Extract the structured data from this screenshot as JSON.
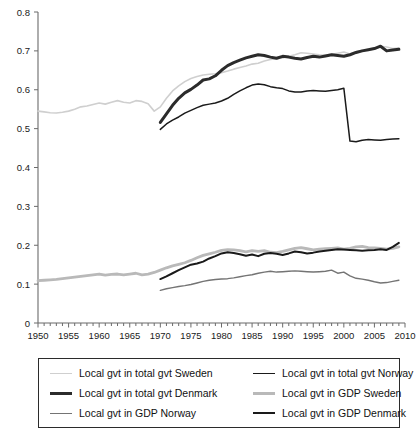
{
  "chart_data": {
    "type": "line",
    "title": "",
    "subtitle": "",
    "xlabel": "",
    "ylabel": "",
    "xlim": [
      1950,
      2010
    ],
    "ylim": [
      0,
      0.8
    ],
    "grid": false,
    "legend_position": "bottom",
    "x_ticks": [
      1950,
      1955,
      1960,
      1965,
      1970,
      1975,
      1980,
      1985,
      1990,
      1995,
      2000,
      2005,
      2010
    ],
    "x_tick_labels": [
      "1950",
      "1955",
      "1960",
      "1965",
      "1970",
      "1975",
      "1980",
      "1985",
      "1990",
      "1995",
      "2000",
      "2005",
      "2010"
    ],
    "x_minor_tick_step": 1,
    "y_ticks": [
      0,
      0.1,
      0.2,
      0.3,
      0.4,
      0.5,
      0.6,
      0.7,
      0.8
    ],
    "y_tick_labels": [
      "0",
      "0.1",
      "0.2",
      "0.3",
      "0.4",
      "0.5",
      "0.6",
      "0.7",
      "0.8"
    ],
    "series": [
      {
        "name": "Local gvt in total gvt Sweden",
        "color": "#cfcfcf",
        "width": 1.6,
        "x": [
          1950,
          1951,
          1952,
          1953,
          1954,
          1955,
          1956,
          1957,
          1958,
          1959,
          1960,
          1961,
          1962,
          1963,
          1964,
          1965,
          1966,
          1967,
          1968,
          1969,
          1970,
          1971,
          1972,
          1973,
          1974,
          1975,
          1976,
          1977,
          1978,
          1979,
          1980,
          1981,
          1982,
          1983,
          1984,
          1985,
          1986,
          1987,
          1988,
          1989,
          1990,
          1991,
          1992,
          1993,
          1994,
          1995,
          1996,
          1997,
          1998,
          1999,
          2000,
          2001,
          2002,
          2003,
          2004,
          2005,
          2006,
          2007,
          2008,
          2009
        ],
        "values": [
          0.545,
          0.543,
          0.541,
          0.54,
          0.542,
          0.545,
          0.55,
          0.556,
          0.558,
          0.562,
          0.566,
          0.563,
          0.568,
          0.572,
          0.568,
          0.566,
          0.572,
          0.57,
          0.564,
          0.545,
          0.556,
          0.578,
          0.597,
          0.61,
          0.621,
          0.629,
          0.634,
          0.638,
          0.64,
          0.641,
          0.644,
          0.648,
          0.653,
          0.657,
          0.661,
          0.666,
          0.668,
          0.674,
          0.678,
          0.68,
          0.682,
          0.686,
          0.69,
          0.695,
          0.694,
          0.692,
          0.69,
          0.689,
          0.691,
          0.694,
          0.697,
          0.692,
          0.698,
          0.701,
          0.703,
          0.706,
          0.712,
          0.71,
          0.706,
          0.707
        ]
      },
      {
        "name": "Local gvt in total gvt  Norway",
        "color": "#1a1a1a",
        "width": 1.5,
        "x": [
          1970,
          1971,
          1972,
          1973,
          1974,
          1975,
          1976,
          1977,
          1978,
          1979,
          1980,
          1981,
          1982,
          1983,
          1984,
          1985,
          1986,
          1987,
          1988,
          1989,
          1990,
          1991,
          1992,
          1993,
          1994,
          1995,
          1996,
          1997,
          1998,
          1999,
          2000,
          2001,
          2002,
          2003,
          2004,
          2005,
          2006,
          2007,
          2008,
          2009
        ],
        "values": [
          0.498,
          0.512,
          0.522,
          0.53,
          0.54,
          0.547,
          0.554,
          0.56,
          0.563,
          0.566,
          0.571,
          0.578,
          0.588,
          0.597,
          0.605,
          0.612,
          0.615,
          0.613,
          0.608,
          0.605,
          0.603,
          0.597,
          0.594,
          0.594,
          0.597,
          0.598,
          0.597,
          0.596,
          0.598,
          0.6,
          0.604,
          0.468,
          0.466,
          0.47,
          0.472,
          0.471,
          0.47,
          0.472,
          0.473,
          0.474
        ]
      },
      {
        "name": "Local gvt in total gvt Denmark",
        "color": "#2b2b2b",
        "width": 3.0,
        "x": [
          1970,
          1971,
          1972,
          1973,
          1974,
          1975,
          1976,
          1977,
          1978,
          1979,
          1980,
          1981,
          1982,
          1983,
          1984,
          1985,
          1986,
          1987,
          1988,
          1989,
          1990,
          1991,
          1992,
          1993,
          1994,
          1995,
          1996,
          1997,
          1998,
          1999,
          2000,
          2001,
          2002,
          2003,
          2004,
          2005,
          2006,
          2007,
          2008,
          2009
        ],
        "values": [
          0.516,
          0.538,
          0.56,
          0.578,
          0.592,
          0.601,
          0.612,
          0.625,
          0.628,
          0.636,
          0.65,
          0.662,
          0.67,
          0.676,
          0.682,
          0.686,
          0.69,
          0.688,
          0.684,
          0.681,
          0.686,
          0.684,
          0.681,
          0.679,
          0.683,
          0.686,
          0.684,
          0.687,
          0.69,
          0.688,
          0.686,
          0.69,
          0.696,
          0.7,
          0.703,
          0.706,
          0.712,
          0.7,
          0.702,
          0.704
        ]
      },
      {
        "name": "Local gvt in GDP Sweden",
        "color": "#b9b9b9",
        "width": 2.8,
        "x": [
          1950,
          1951,
          1952,
          1953,
          1954,
          1955,
          1956,
          1957,
          1958,
          1959,
          1960,
          1961,
          1962,
          1963,
          1964,
          1965,
          1966,
          1967,
          1968,
          1969,
          1970,
          1971,
          1972,
          1973,
          1974,
          1975,
          1976,
          1977,
          1978,
          1979,
          1980,
          1981,
          1982,
          1983,
          1984,
          1985,
          1986,
          1987,
          1988,
          1989,
          1990,
          1991,
          1992,
          1993,
          1994,
          1995,
          1996,
          1997,
          1998,
          1999,
          2000,
          2001,
          2002,
          2003,
          2004,
          2005,
          2006,
          2007,
          2008,
          2009
        ],
        "values": [
          0.109,
          0.11,
          0.111,
          0.112,
          0.114,
          0.116,
          0.118,
          0.12,
          0.122,
          0.124,
          0.126,
          0.123,
          0.125,
          0.126,
          0.124,
          0.126,
          0.128,
          0.124,
          0.126,
          0.13,
          0.136,
          0.142,
          0.147,
          0.151,
          0.155,
          0.161,
          0.168,
          0.174,
          0.178,
          0.182,
          0.187,
          0.189,
          0.188,
          0.186,
          0.183,
          0.186,
          0.184,
          0.186,
          0.182,
          0.181,
          0.184,
          0.188,
          0.192,
          0.194,
          0.191,
          0.188,
          0.19,
          0.191,
          0.192,
          0.193,
          0.19,
          0.192,
          0.196,
          0.197,
          0.194,
          0.193,
          0.192,
          0.19,
          0.192,
          0.196
        ]
      },
      {
        "name": "Local gvt in GDP Norway",
        "color": "#747474",
        "width": 1.4,
        "x": [
          1970,
          1971,
          1972,
          1973,
          1974,
          1975,
          1976,
          1977,
          1978,
          1979,
          1980,
          1981,
          1982,
          1983,
          1984,
          1985,
          1986,
          1987,
          1988,
          1989,
          1990,
          1991,
          1992,
          1993,
          1994,
          1995,
          1996,
          1997,
          1998,
          1999,
          2000,
          2001,
          2002,
          2003,
          2004,
          2005,
          2006,
          2007,
          2008,
          2009
        ],
        "values": [
          0.084,
          0.088,
          0.091,
          0.094,
          0.096,
          0.099,
          0.103,
          0.107,
          0.11,
          0.112,
          0.113,
          0.114,
          0.116,
          0.119,
          0.122,
          0.124,
          0.128,
          0.131,
          0.133,
          0.131,
          0.132,
          0.133,
          0.134,
          0.133,
          0.132,
          0.131,
          0.132,
          0.133,
          0.136,
          0.128,
          0.131,
          0.121,
          0.115,
          0.113,
          0.11,
          0.106,
          0.103,
          0.104,
          0.107,
          0.11
        ]
      },
      {
        "name": "Local gvt in GDP Denmark",
        "color": "#1a1a1a",
        "width": 2.0,
        "x": [
          1970,
          1971,
          1972,
          1973,
          1974,
          1975,
          1976,
          1977,
          1978,
          1979,
          1980,
          1981,
          1982,
          1983,
          1984,
          1985,
          1986,
          1987,
          1988,
          1989,
          1990,
          1991,
          1992,
          1993,
          1994,
          1995,
          1996,
          1997,
          1998,
          1999,
          2000,
          2001,
          2002,
          2003,
          2004,
          2005,
          2006,
          2007,
          2008,
          2009
        ],
        "values": [
          0.113,
          0.12,
          0.128,
          0.136,
          0.143,
          0.15,
          0.153,
          0.158,
          0.166,
          0.172,
          0.179,
          0.182,
          0.18,
          0.177,
          0.173,
          0.176,
          0.172,
          0.178,
          0.18,
          0.178,
          0.175,
          0.179,
          0.184,
          0.182,
          0.179,
          0.181,
          0.184,
          0.186,
          0.188,
          0.19,
          0.189,
          0.188,
          0.187,
          0.186,
          0.187,
          0.188,
          0.19,
          0.188,
          0.196,
          0.206
        ]
      }
    ]
  },
  "legend": {
    "entries": [
      {
        "label": "Local gvt in total gvt Sweden",
        "color": "#cfcfcf",
        "width": 1.6,
        "swatch": "legend-line-total-sweden"
      },
      {
        "label": "Local gvt in total gvt  Norway",
        "color": "#1a1a1a",
        "width": 1.8,
        "swatch": "legend-line-total-norway"
      },
      {
        "label": "Local gvt in total gvt Denmark",
        "color": "#2b2b2b",
        "width": 3.2,
        "swatch": "legend-line-total-denmark"
      },
      {
        "label": "Local gvt in GDP Sweden",
        "color": "#b9b9b9",
        "width": 3.0,
        "swatch": "legend-line-gdp-sweden"
      },
      {
        "label": "Local gvt in GDP Norway",
        "color": "#747474",
        "width": 1.5,
        "swatch": "legend-line-gdp-norway"
      },
      {
        "label": "Local gvt in GDP Denmark",
        "color": "#1a1a1a",
        "width": 2.4,
        "swatch": "legend-line-gdp-denmark"
      }
    ]
  }
}
